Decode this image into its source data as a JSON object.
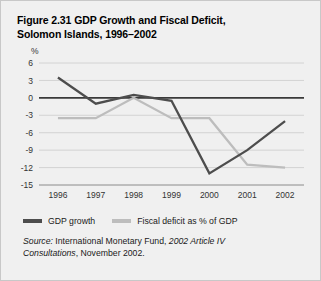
{
  "figure": {
    "title": "Figure 2.31  GDP Growth and Fiscal Deficit,\nSolomon Islands, 1996–2002",
    "axis_unit": "%"
  },
  "legend": {
    "items": [
      {
        "label": "GDP growth",
        "color": "#4d4d4d"
      },
      {
        "label": "Fiscal deficit as % of GDP",
        "color": "#bdbdbd"
      }
    ]
  },
  "source": {
    "label": "Source:",
    "text_before": " International Monetary Fund, ",
    "italic_title": "2002 Article IV Consultations",
    "text_after": ", November 2002."
  },
  "colors": {
    "background": "#f0f0f0",
    "border": "#c8c8c8",
    "gridline": "#cfcfcf",
    "zeroline": "#3a3a3a",
    "gdp_growth": "#4d4d4d",
    "fiscal_deficit": "#bdbdbd"
  },
  "chart_data": {
    "type": "line",
    "title": "Figure 2.31  GDP Growth and Fiscal Deficit, Solomon Islands, 1996–2002",
    "xlabel": "",
    "ylabel": "%",
    "categories": [
      "1996",
      "1997",
      "1998",
      "1999",
      "2000",
      "2001",
      "2002"
    ],
    "yticks": [
      6,
      3,
      0,
      -3,
      -6,
      -9,
      -12,
      -15
    ],
    "ylim": [
      -15,
      6
    ],
    "grid": true,
    "legend_position": "bottom-left",
    "series": [
      {
        "name": "GDP growth",
        "color": "#4d4d4d",
        "values": [
          3.5,
          -1.0,
          0.5,
          -0.5,
          -13.0,
          -9.0,
          -4.0
        ]
      },
      {
        "name": "Fiscal deficit as % of GDP",
        "color": "#bdbdbd",
        "values": [
          -3.5,
          -3.5,
          0.0,
          -3.5,
          -3.5,
          -11.5,
          -12.0
        ]
      }
    ]
  }
}
